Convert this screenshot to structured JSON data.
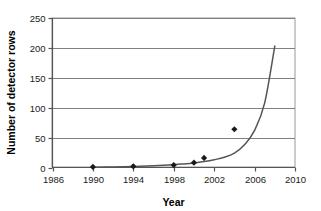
{
  "chart_data": {
    "type": "scatter",
    "title": "",
    "xlabel": "Year",
    "ylabel": "Number of detector rows",
    "xlim": [
      1986,
      2010
    ],
    "ylim": [
      0,
      250
    ],
    "xticks": [
      1986,
      1990,
      1994,
      1998,
      2002,
      2006,
      2010
    ],
    "yticks": [
      0,
      50,
      100,
      150,
      200,
      250
    ],
    "grid": "horizontal",
    "legend": "none",
    "series": [
      {
        "name": "detector rows",
        "marker": "diamond",
        "color": "#1a1a1a",
        "x": [
          1990,
          1994,
          1998,
          2000,
          2001,
          2004
        ],
        "y": [
          1,
          2,
          4,
          8,
          16,
          64
        ]
      },
      {
        "name": "exponential trend",
        "marker": "none",
        "style": "line",
        "color": "#555555",
        "x": [
          1990,
          1992,
          1994,
          1996,
          1998,
          1999,
          2000,
          2001,
          2002,
          2003,
          2004,
          2005,
          2006,
          2007,
          2008
        ],
        "y": [
          0.6,
          1.0,
          1.7,
          2.8,
          4.6,
          6.0,
          7.7,
          10.0,
          13.0,
          17.0,
          24.0,
          38.0,
          62.0,
          108.0,
          203.0
        ]
      }
    ]
  },
  "axes": {
    "x_tick_labels": [
      "1986",
      "1990",
      "1994",
      "1998",
      "2002",
      "2006",
      "2010"
    ],
    "y_tick_labels": [
      "0",
      "50",
      "100",
      "150",
      "200",
      "250"
    ],
    "x_axis_title": "Year",
    "y_axis_title": "Number of detector rows"
  },
  "colors": {
    "marker": "#1a1a1a",
    "curve": "#555555",
    "gridline": "#808080",
    "axis": "#555555",
    "plot_background": "#ffffff"
  }
}
